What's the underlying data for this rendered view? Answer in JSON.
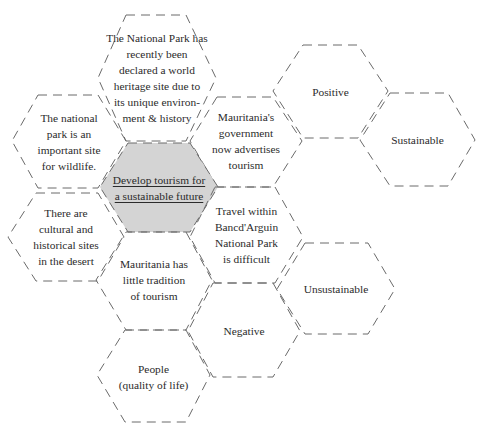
{
  "diagram": {
    "type": "hexagon-thinking-map",
    "center": {
      "id": "center",
      "text": "Develop tourism for\na sustainable future",
      "highlight_color": "#d4d4d4"
    },
    "hexagons": [
      {
        "id": "world-heritage",
        "text": "The National Park has\nrecently been\ndeclared a world\nheritage site due to\nits unique environ-\nment & history"
      },
      {
        "id": "wildlife",
        "text": "The national\npark is an\nimportant site\nfor wildlife."
      },
      {
        "id": "cultural-sites",
        "text": "There are\ncultural and\nhistorical sites\nin the desert"
      },
      {
        "id": "government-advertises",
        "text": "Mauritania's\ngovernment\nnow advertises\ntourism"
      },
      {
        "id": "travel-difficult",
        "text": "Travel within\nBancd'Arguin\nNational Park\nis difficult"
      },
      {
        "id": "little-tradition",
        "text": "Mauritania has\nlittle tradition\nof tourism"
      },
      {
        "id": "negative",
        "text": "Negative"
      },
      {
        "id": "people",
        "text": "People\n(quality of life)"
      },
      {
        "id": "positive",
        "text": "Positive"
      },
      {
        "id": "sustainable",
        "text": "Sustainable"
      },
      {
        "id": "unsustainable",
        "text": "Unsustainable"
      }
    ],
    "colors": {
      "stroke": "#6a6a6a",
      "text": "#2b2b2b",
      "center_fill": "#d4d4d4"
    }
  }
}
